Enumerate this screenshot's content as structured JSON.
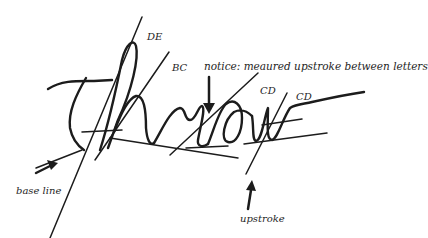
{
  "diagram": {
    "word": "throw",
    "labels": {
      "de": "DE",
      "bc": "BC",
      "cd_1": "CD",
      "cd_2": "CD",
      "notice": "notice: meaured upstroke between letters",
      "base_line": "base line",
      "upstroke": "upstroke"
    },
    "colors": {
      "ink": "#1c1c1c",
      "background": "#ffffff"
    }
  }
}
